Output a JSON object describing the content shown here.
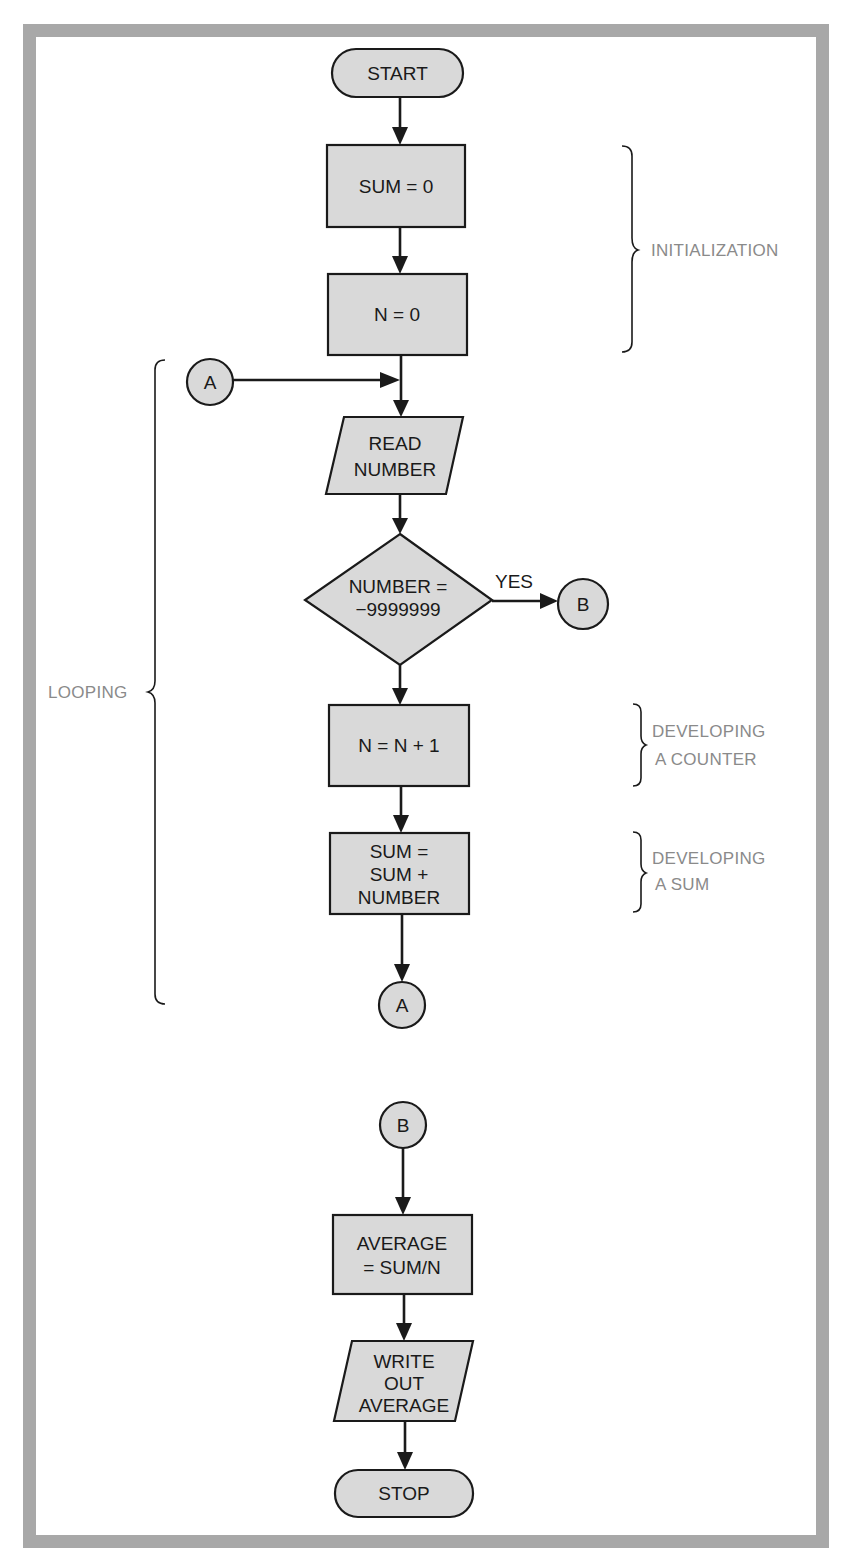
{
  "diagram": {
    "type": "flowchart",
    "frame_color": "#a8a8a8",
    "shape_fill": "#d9d9d9",
    "nodes": {
      "start": "START",
      "sum_init": "SUM = 0",
      "n_init": "N = 0",
      "connector_a_top": "A",
      "read": [
        "READ",
        "NUMBER"
      ],
      "decision": [
        "NUMBER =",
        "−9999999"
      ],
      "decision_yes": "YES",
      "connector_b_right": "B",
      "counter": "N = N + 1",
      "sum_update": [
        "SUM =",
        "SUM +",
        "NUMBER"
      ],
      "connector_a_bottom": "A",
      "connector_b_bottom": "B",
      "average": [
        "AVERAGE",
        "= SUM/N"
      ],
      "write": [
        "WRITE",
        "OUT",
        "AVERAGE"
      ],
      "stop": "STOP"
    },
    "annotations": {
      "initialization": "INITIALIZATION",
      "looping": "LOOPING",
      "counter": [
        "DEVELOPING",
        "A COUNTER"
      ],
      "sum": [
        "DEVELOPING",
        "A SUM"
      ]
    }
  }
}
